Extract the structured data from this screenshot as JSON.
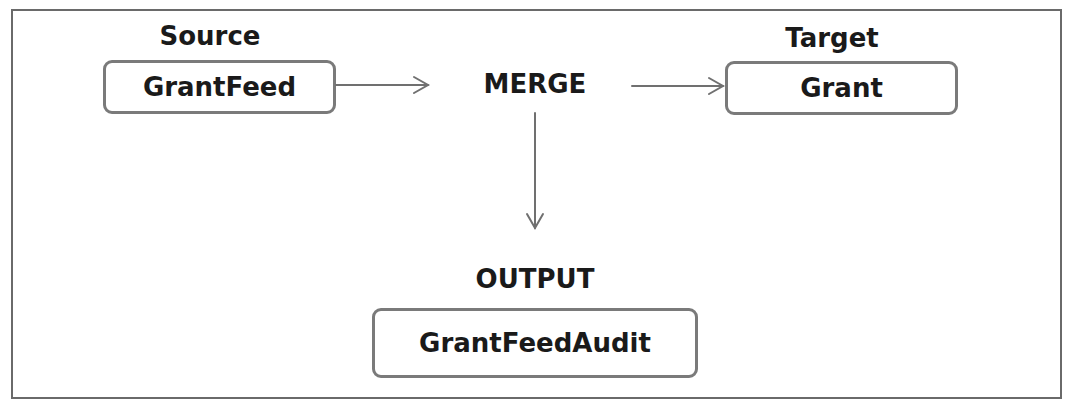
{
  "diagram": {
    "source": {
      "heading": "Source",
      "node": "GrantFeed"
    },
    "operation": {
      "label": "MERGE"
    },
    "target": {
      "heading": "Target",
      "node": "Grant"
    },
    "output": {
      "heading": "OUTPUT",
      "node": "GrantFeedAudit"
    },
    "edges": [
      {
        "from": "GrantFeed",
        "to": "MERGE"
      },
      {
        "from": "MERGE",
        "to": "Grant"
      },
      {
        "from": "MERGE",
        "to": "GrantFeedAudit"
      }
    ],
    "colors": {
      "border": "#6a6a6a",
      "node_border": "#7a7a7a",
      "arrow": "#707070",
      "text": "#1a1a1a"
    }
  }
}
